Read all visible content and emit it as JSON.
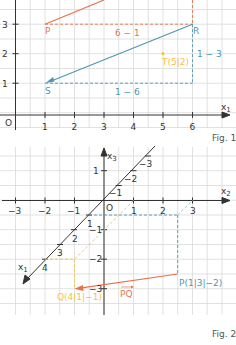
{
  "colors": {
    "orange": "#e8734a",
    "blue": "#4f97b0",
    "yellow": "#f2c34a",
    "axis": "#333333",
    "grid": "#d9d9d9",
    "caption": "#555555"
  },
  "fig1": {
    "caption": "Fig. 1",
    "axis_label_x": "x1",
    "axis_label_x_main": "x",
    "axis_label_x_sub": "1",
    "origin_label": "O",
    "x_ticks": [
      "1",
      "2",
      "3",
      "4",
      "5",
      "6"
    ],
    "y_ticks": [
      "1",
      "2",
      "3"
    ],
    "points": {
      "P": {
        "label": "P",
        "x": 1,
        "y": 3
      },
      "R": {
        "label": "R",
        "x": 6,
        "y": 3
      },
      "S": {
        "label": "S",
        "x": 1,
        "y": 1
      },
      "T": {
        "label": "T(5|2)",
        "x": 5,
        "y": 2
      }
    },
    "annotations": {
      "orange_diff": "6 − 1",
      "blue_diff_x": "1 − 6",
      "blue_diff_y": "1 − 3"
    }
  },
  "fig2": {
    "caption": "Fig. 2",
    "axis_label_x2_main": "x",
    "axis_label_x2_sub": "2",
    "axis_label_x3_main": "x",
    "axis_label_x3_sub": "3",
    "axis_label_x1_main": "x",
    "axis_label_x1_sub": "1",
    "origin_label": "O",
    "x2_ticks": [
      "−3",
      "−2",
      "−1",
      "1",
      "2",
      "3"
    ],
    "x3_ticks": [
      "1",
      "−1",
      "−2",
      "−3"
    ],
    "x1_ticks_pos": [
      "1",
      "2",
      "3",
      "4"
    ],
    "x1_ticks_neg": [
      "−1",
      "−2",
      "−3"
    ],
    "points": {
      "P": {
        "label": "P(1|3|−2)",
        "x1": 1,
        "x2": 3,
        "x3": -2
      },
      "Q": {
        "label": "Q(4|1|−1)",
        "x1": 4,
        "x2": 1,
        "x3": -1
      }
    },
    "vector_label": "PQ"
  }
}
